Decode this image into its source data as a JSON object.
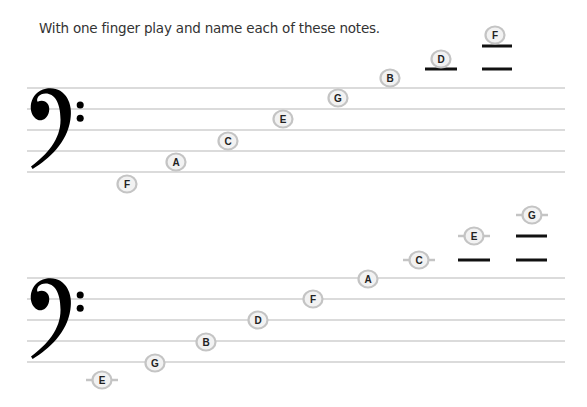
{
  "instruction": "With one finger play and name each of these notes.",
  "clef": "bass-clef",
  "staves": [
    {
      "name": "staff-1",
      "notes": [
        {
          "letter": "F",
          "position": "below-staff-space"
        },
        {
          "letter": "A",
          "position": "space-1"
        },
        {
          "letter": "C",
          "position": "space-2"
        },
        {
          "letter": "E",
          "position": "space-3"
        },
        {
          "letter": "G",
          "position": "space-4"
        },
        {
          "letter": "B",
          "position": "above-staff-space"
        },
        {
          "letter": "D",
          "position": "above-ledger-1"
        },
        {
          "letter": "F",
          "position": "above-ledger-2"
        }
      ]
    },
    {
      "name": "staff-2",
      "notes": [
        {
          "letter": "E",
          "position": "below-ledger-1"
        },
        {
          "letter": "G",
          "position": "line-1"
        },
        {
          "letter": "B",
          "position": "line-2"
        },
        {
          "letter": "D",
          "position": "line-3"
        },
        {
          "letter": "F",
          "position": "line-4"
        },
        {
          "letter": "A",
          "position": "line-5"
        },
        {
          "letter": "C",
          "position": "ledger-1"
        },
        {
          "letter": "E",
          "position": "ledger-2"
        },
        {
          "letter": "G",
          "position": "ledger-3"
        }
      ]
    }
  ]
}
